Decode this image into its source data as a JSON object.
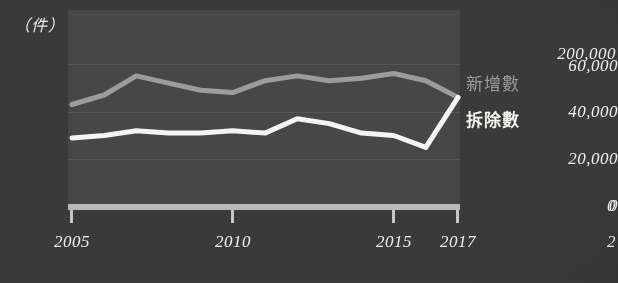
{
  "chart_data": {
    "type": "line",
    "title": "",
    "unit_label": "（件）",
    "xlabel": "",
    "ylabel": "",
    "x": [
      2005,
      2006,
      2007,
      2008,
      2009,
      2010,
      2011,
      2012,
      2013,
      2014,
      2015,
      2016,
      2017
    ],
    "xtick_labels": [
      "2005",
      "2010",
      "2015",
      "2017"
    ],
    "xtick_values": [
      2005,
      2010,
      2015,
      2017
    ],
    "xlim": [
      2005,
      2017
    ],
    "ytick_labels": [
      "0",
      "20,000",
      "40,000",
      "60,000"
    ],
    "ytick_values": [
      0,
      20000,
      40000,
      60000
    ],
    "ylim": [
      0,
      68000
    ],
    "grid": true,
    "legend_position": "right",
    "series": [
      {
        "name": "新增數",
        "color": "#9c9c98",
        "values": [
          43000,
          47000,
          55000,
          52000,
          49000,
          48000,
          53000,
          55000,
          53000,
          54000,
          56000,
          53000,
          46000
        ]
      },
      {
        "name": "拆除數",
        "color": "#f4f4f1",
        "values": [
          29000,
          30000,
          32000,
          31000,
          31000,
          32000,
          31000,
          37000,
          35000,
          31000,
          30000,
          25000,
          46000
        ]
      }
    ]
  },
  "side_chart": {
    "ytick_top": "200,000",
    "ytick_zero": "0",
    "xtick_partial": "2"
  }
}
